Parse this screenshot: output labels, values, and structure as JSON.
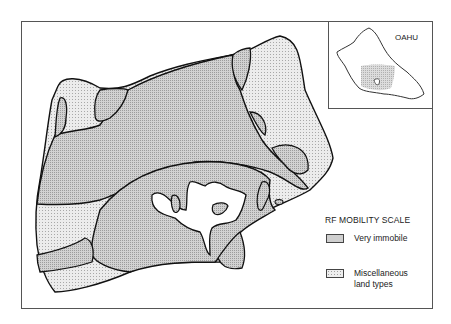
{
  "map": {
    "inset_label": "OAHU",
    "legend": {
      "title": "RF MOBILITY SCALE",
      "items": [
        {
          "label": "Very immobile",
          "pattern": "dense-stipple",
          "color": "#cfcfcf"
        },
        {
          "label": "Miscellaneous land types",
          "pattern": "light-stipple",
          "color": "#eeeeee"
        }
      ]
    }
  }
}
